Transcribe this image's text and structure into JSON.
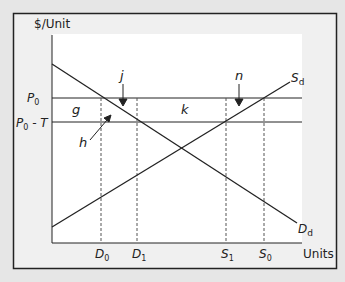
{
  "diagram": {
    "type": "supply-demand-tariff",
    "y_axis_label": "$/Unit",
    "x_axis_label": "Units",
    "price_levels": [
      {
        "id": "p0",
        "main": "P",
        "sub": "0",
        "suffix": ""
      },
      {
        "id": "p0t",
        "main": "P",
        "sub": "0",
        "suffix": " - T"
      }
    ],
    "curves": {
      "supply": {
        "main": "S",
        "sub": "d"
      },
      "demand": {
        "main": "D",
        "sub": "d"
      }
    },
    "quantity_markers": [
      {
        "id": "d0",
        "main": "D",
        "sub": "0"
      },
      {
        "id": "d1",
        "main": "D",
        "sub": "1"
      },
      {
        "id": "s1",
        "main": "S",
        "sub": "1"
      },
      {
        "id": "s0",
        "main": "S",
        "sub": "0"
      }
    ],
    "area_labels": {
      "g": "g",
      "h": "h",
      "j": "j",
      "k": "k",
      "n": "n"
    },
    "colors": {
      "background": "#e6e6e6",
      "frame_fill": "#f0f0f0",
      "plot_fill": "#ffffff",
      "line": "#222222",
      "dashed": "#555555"
    }
  }
}
